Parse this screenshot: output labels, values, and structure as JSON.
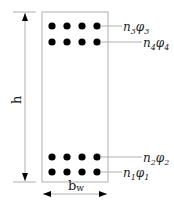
{
  "diagram": {
    "height_label": "h",
    "width_label_main": "b",
    "width_label_sub": "w",
    "colors": {
      "line": "#b0b0b0",
      "bar": "#000000",
      "text": "#222222"
    },
    "layers": [
      {
        "n": "n",
        "n_sub": "3",
        "phi": "φ",
        "phi_sub": "3",
        "y": 26,
        "label_x": 122,
        "label_y": 31
      },
      {
        "n": "n",
        "n_sub": "4",
        "phi": "φ",
        "phi_sub": "4",
        "y": 42,
        "label_x": 142,
        "label_y": 48
      },
      {
        "n": "n",
        "n_sub": "2",
        "phi": "φ",
        "phi_sub": "2",
        "y": 157,
        "label_x": 142,
        "label_y": 163
      },
      {
        "n": "n",
        "n_sub": "1",
        "phi": "φ",
        "phi_sub": "1",
        "y": 172,
        "label_x": 122,
        "label_y": 178
      }
    ],
    "bars_per_layer": 4,
    "bar_x": [
      52,
      67,
      82,
      97
    ]
  }
}
